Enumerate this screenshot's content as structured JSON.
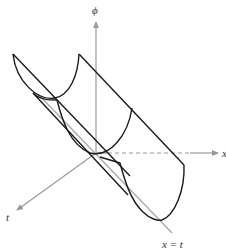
{
  "figure": {
    "axis_labels": {
      "vertical": "ϕ",
      "horizontal": "x",
      "depth": "t"
    },
    "line_label": "x = t",
    "colors": {
      "axis": "#9a9a9a",
      "surface": "#1a1a1a",
      "diagonal_line": "#a8a8a8"
    }
  }
}
